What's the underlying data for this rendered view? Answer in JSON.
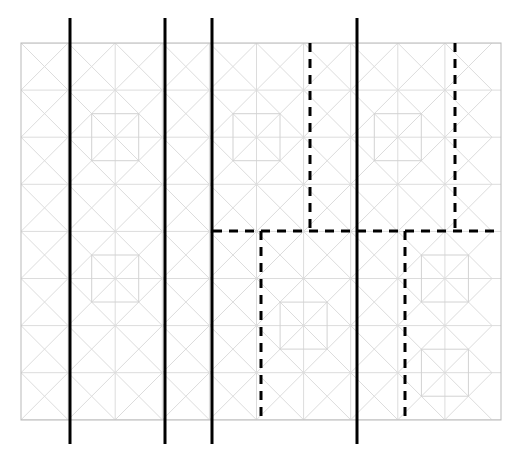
{
  "figure": {
    "title": "",
    "type": "geometric-tiling-diagram",
    "canvas": {
      "width": 525,
      "height": 456,
      "background": "#ffffff"
    },
    "frame": {
      "name": "outer-frame",
      "x": 21,
      "y": 43,
      "width": 480,
      "height": 377,
      "stroke": "#b9b9b9",
      "stroke_width": 1
    },
    "grid": {
      "name": "light-gray-tiling",
      "cell_size": 47.1,
      "columns": 10,
      "rows": 8,
      "stroke": "#dcdcdc",
      "stroke_width": 1,
      "motif": "diagonal-lattice-with-inner-squares",
      "x_positions": [
        21,
        68.1,
        115.2,
        162.3,
        209.4,
        256.5,
        303.6,
        350.7,
        397.8,
        444.9,
        492
      ],
      "y_positions": [
        43,
        90.1,
        137.2,
        184.3,
        231.4,
        278.5,
        325.6,
        372.7,
        419.8
      ]
    },
    "inner_squares": {
      "name": "inner-square-motif",
      "size": 47,
      "stroke": "#d2d2d2",
      "centers": [
        {
          "cx": 115.2,
          "cy": 137.2
        },
        {
          "cx": 256.5,
          "cy": 137.2
        },
        {
          "cx": 397.8,
          "cy": 137.2
        },
        {
          "cx": 115.2,
          "cy": 278.5
        },
        {
          "cx": 303.6,
          "cy": 325.6
        },
        {
          "cx": 444.9,
          "cy": 278.5
        },
        {
          "cx": 444.9,
          "cy": 372.7
        }
      ]
    },
    "solid_lines": {
      "name": "solid-vertical-cuts",
      "stroke": "#000000",
      "stroke_width": 3,
      "orientation": "vertical",
      "y_top": 18,
      "y_bottom": 444,
      "x_values": [
        70,
        165,
        212,
        357
      ],
      "count": 4
    },
    "dashed_lines": {
      "name": "dashed-partition-cuts",
      "stroke": "#000000",
      "stroke_width": 3,
      "dash_pattern": "9 7",
      "vertical": [
        {
          "name": "dashed-v-top-1",
          "x": 310,
          "y1": 43,
          "y2": 231
        },
        {
          "name": "dashed-v-top-2",
          "x": 455,
          "y1": 43,
          "y2": 231
        },
        {
          "name": "dashed-v-bottom-1",
          "x": 261,
          "y1": 231,
          "y2": 420
        },
        {
          "name": "dashed-v-bottom-2",
          "x": 405,
          "y1": 231,
          "y2": 420
        }
      ],
      "horizontal": [
        {
          "name": "dashed-h-main",
          "y": 231,
          "x1": 213,
          "x2": 501
        }
      ]
    },
    "legend": {
      "items": []
    },
    "labels": []
  }
}
